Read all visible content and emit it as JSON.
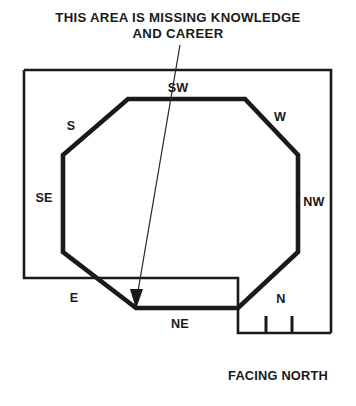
{
  "annotation": {
    "title_line_1": "THIS AREA IS MISSING KNOWLEDGE",
    "title_line_2": "AND CAREER",
    "pointer_name": "missing-area-pointer"
  },
  "compass_labels": {
    "sw": "SW",
    "s": "S",
    "w": "W",
    "se": "SE",
    "nw": "NW",
    "e": "E",
    "ne": "NE",
    "n": "N"
  },
  "orientation": {
    "facing_label": "FACING NORTH"
  },
  "colors": {
    "ink": "#1a1a1a",
    "pointer": "#2a2a2a",
    "background": "#ffffff"
  },
  "geometry": {
    "house_outline_path": "M 24 70 L 331 70 L 331 333 M 24 70 L 24 278 L 238 278 L 238 333 L 331 333",
    "bagua_octagon_points": "128,99 245,99 298,155 298,252 238,308 136,308 63,252 63,155",
    "pointer_path": "M 180 45 L 137 297",
    "pointer_head_points": "136,309 130,289 143,289",
    "door_jamb_left": "M 266 333 L 266 316",
    "door_jamb_right": "M 292 333 L 292 316"
  }
}
